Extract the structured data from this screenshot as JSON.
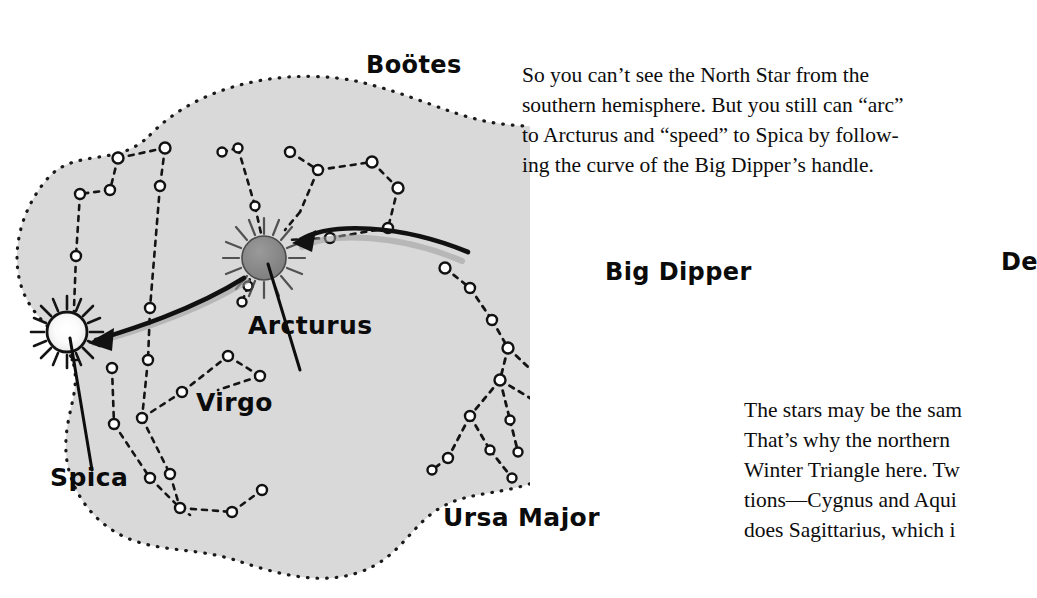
{
  "page": {
    "width": 1037,
    "height": 598,
    "background": "#ffffff",
    "ink": "#0d0d0d"
  },
  "illustration": {
    "name": "star-map-arc-to-arcturus-speed-to-spica",
    "blob_fill": "#d9d9d9",
    "blob_stroke": "#1a1a1a",
    "star_outline": "#111111",
    "star_fill_light": "#ffffff",
    "arcturus_fill": "#8c8c8c",
    "labels": [
      {
        "id": "bootes",
        "text": "Boötes"
      },
      {
        "id": "arcturus",
        "text": "Arcturus"
      },
      {
        "id": "virgo",
        "text": "Virgo"
      },
      {
        "id": "spica",
        "text": "Spica"
      },
      {
        "id": "big-dipper",
        "text": "Big Dipper"
      },
      {
        "id": "ursa-major",
        "text": "Ursa Major"
      },
      {
        "id": "deneb",
        "text": "De"
      }
    ],
    "named_stars": [
      {
        "name": "Arcturus",
        "style": "filled-gray-with-rays"
      },
      {
        "name": "Spica",
        "style": "white-with-rays"
      }
    ],
    "arrows": [
      {
        "name": "arc-to-arcturus",
        "from": "big-dipper-handle",
        "to": "Arcturus"
      },
      {
        "name": "speed-to-spica",
        "from": "Arcturus",
        "to": "Spica"
      }
    ]
  },
  "text": {
    "paragraph_top": {
      "name": "north-star-paragraph",
      "lines": [
        "So you can’t see the North Star from the",
        "southern hemisphere. But you still can “arc”",
        "to Arcturus and “speed” to Spica by follow-",
        "ing the curve of the Big Dipper’s handle."
      ]
    },
    "paragraph_bottom": {
      "name": "winter-triangle-paragraph",
      "lines": [
        "The stars may be the sam",
        "That’s why the northern",
        "Winter Triangle here. Tw",
        "tions—Cygnus and Aqui",
        "does Sagittarius, which i"
      ]
    }
  }
}
